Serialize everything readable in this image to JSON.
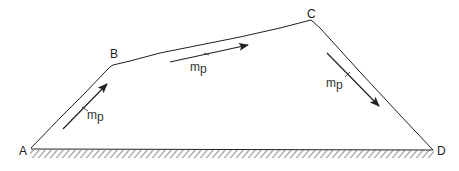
{
  "diagram": {
    "type": "trapezoidal-path-on-ground",
    "colors": {
      "line": "#222222",
      "hatch": "#555555",
      "background": "#ffffff"
    },
    "points": {
      "A": {
        "label": "A",
        "x": 31,
        "y": 148
      },
      "B": {
        "label": "B",
        "x": 113,
        "y": 65
      },
      "C": {
        "label": "C",
        "x": 311,
        "y": 20
      },
      "D": {
        "label": "D",
        "x": 433,
        "y": 150
      }
    },
    "segments": [
      {
        "from": "A",
        "to": "B"
      },
      {
        "from": "B",
        "to": "C"
      },
      {
        "from": "C",
        "to": "D"
      },
      {
        "from": "A",
        "to": "D",
        "style": "ground-hatched"
      }
    ],
    "arrows": [
      {
        "segment": "AB",
        "label_main": "m",
        "label_sub": "p",
        "direction": "up-right"
      },
      {
        "segment": "BC",
        "label_main": "m",
        "label_sub": "p",
        "direction": "right"
      },
      {
        "segment": "CD",
        "label_main": "m",
        "label_sub": "p",
        "direction": "down-right"
      }
    ]
  }
}
